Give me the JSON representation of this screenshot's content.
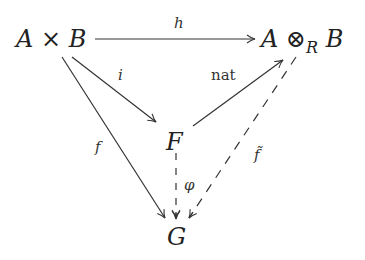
{
  "diagram": {
    "type": "commutative-diagram",
    "nodes": {
      "AxB": {
        "A": "A",
        "op": "×",
        "B": "B"
      },
      "AtensorB": {
        "A": "A",
        "op": "⊗",
        "sub": "R",
        "B": "B"
      },
      "F": "F",
      "G": "G"
    },
    "arrows": [
      {
        "id": "h",
        "from": "A × B",
        "to": "A ⊗_R B",
        "label": "h",
        "style": "solid"
      },
      {
        "id": "i",
        "from": "A × B",
        "to": "F",
        "label": "i",
        "style": "solid"
      },
      {
        "id": "f",
        "from": "A × B",
        "to": "G",
        "label": "f",
        "style": "solid"
      },
      {
        "id": "nat",
        "from": "F",
        "to": "A ⊗_R B",
        "label": "nat",
        "style": "solid"
      },
      {
        "id": "phi",
        "from": "F",
        "to": "G",
        "label": "φ",
        "style": "dashed"
      },
      {
        "id": "ftilde",
        "from": "A ⊗_R B",
        "to": "G",
        "label": "f̃",
        "style": "dashed"
      }
    ]
  }
}
